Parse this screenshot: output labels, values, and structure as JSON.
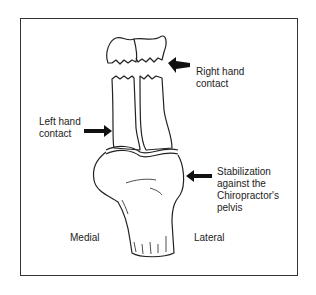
{
  "diagram": {
    "labels": {
      "right_hand": "Right hand\ncontact",
      "left_hand": "Left hand\ncontact",
      "stabilization": "Stabilization\nagainst the\nChiropractor's\npelvis",
      "medial": "Medial",
      "lateral": "Lateral"
    },
    "colors": {
      "line": "#222222",
      "background": "#ffffff"
    }
  }
}
